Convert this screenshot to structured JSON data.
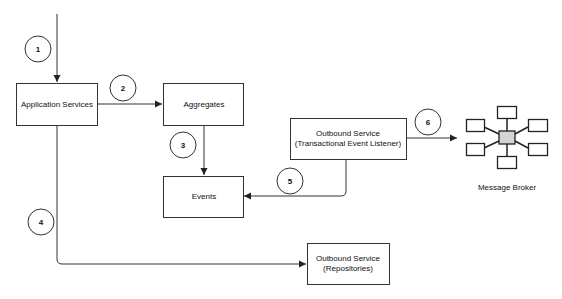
{
  "diagram": {
    "nodes": {
      "app_services": {
        "label": "Application Services"
      },
      "aggregates": {
        "label": "Aggregates"
      },
      "events": {
        "label": "Events"
      },
      "outbound_listener": {
        "line1": "Outbound Service",
        "line2": "(Transactional Event Listener)"
      },
      "outbound_repositories": {
        "line1": "Outbound Service",
        "line2": "(Repositories)"
      },
      "message_broker": {
        "label": "Message Broker"
      }
    },
    "steps": [
      "1",
      "2",
      "3",
      "4",
      "5",
      "6"
    ],
    "edges": [
      {
        "from": "external",
        "to": "Application Services",
        "step": "1"
      },
      {
        "from": "Application Services",
        "to": "Aggregates",
        "step": "2"
      },
      {
        "from": "Aggregates",
        "to": "Events",
        "step": "3"
      },
      {
        "from": "Application Services",
        "to": "Outbound Service (Repositories)",
        "step": "4"
      },
      {
        "from": "Outbound Service (Transactional Event Listener)",
        "to": "Events",
        "step": "5"
      },
      {
        "from": "Outbound Service (Transactional Event Listener)",
        "to": "Message Broker",
        "step": "6"
      }
    ],
    "colors": {
      "stroke": "#333333",
      "hub_fill": "#d4d4d4",
      "background": "#ffffff"
    }
  }
}
